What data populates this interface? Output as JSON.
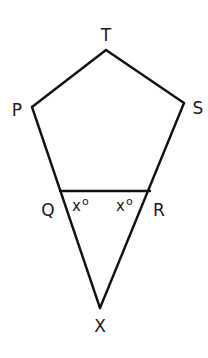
{
  "diagram": {
    "type": "geometry",
    "stroke_color": "#111111",
    "background": "#ffffff",
    "vertices": {
      "T": {
        "label": "T",
        "x": 106,
        "y": 50
      },
      "P": {
        "label": "P",
        "x": 32,
        "y": 107
      },
      "S": {
        "label": "S",
        "x": 184,
        "y": 103
      },
      "Q": {
        "label": "Q",
        "x": 60,
        "y": 191
      },
      "R": {
        "label": "R",
        "x": 150,
        "y": 191
      },
      "X": {
        "label": "X",
        "x": 100,
        "y": 308
      }
    },
    "angles": [
      {
        "at": "Q",
        "label": "x",
        "unit": "o"
      },
      {
        "at": "R",
        "label": "x",
        "unit": "o"
      }
    ]
  }
}
